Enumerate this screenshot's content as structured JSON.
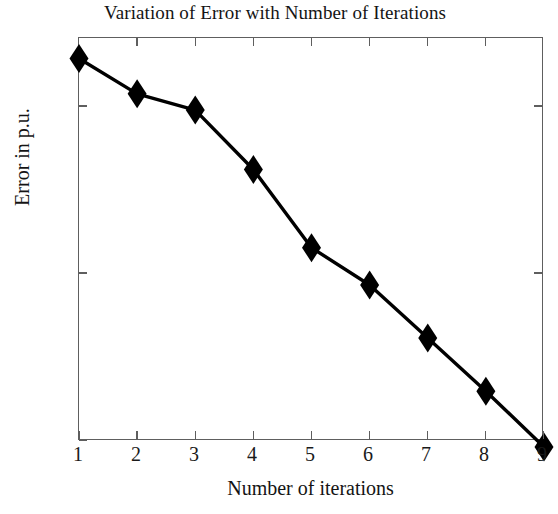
{
  "chart_data": {
    "type": "line",
    "title": "Variation of Error with Number of Iterations",
    "xlabel": "Number of iterations",
    "ylabel": "Error in p.u.",
    "x": [
      1,
      2,
      3,
      4,
      5,
      6,
      7,
      8,
      9
    ],
    "values": [
      25,
      2.2,
      0.72,
      0.012,
      5.5e-05,
      4.2e-06,
      1.1e-07,
      2.8e-09,
      6e-11
    ],
    "series": [
      {
        "name": "Error",
        "marker": "diamond",
        "marker_color": "#000000",
        "line_color": "#000000",
        "values": [
          25,
          2.2,
          0.72,
          0.012,
          5.5e-05,
          4.2e-06,
          1.1e-07,
          2.8e-09,
          6e-11
        ]
      }
    ],
    "xlim": [
      1,
      9
    ],
    "ylim": [
      1e-10,
      1000
    ],
    "yscale": "log",
    "xscale": "linear",
    "grid": false,
    "legend": null,
    "xtick_labels": [
      "1",
      "2",
      "3",
      "4",
      "5",
      "6",
      "7",
      "8",
      "9"
    ],
    "xticks": [
      1,
      2,
      3,
      4,
      5,
      6,
      7,
      8,
      9
    ],
    "yticks": [
      1,
      1e-05,
      1e-10
    ],
    "ytick_labels": [
      {
        "mantissa": "10",
        "exponent": "0"
      },
      {
        "mantissa": "10",
        "exponent": "-5"
      },
      {
        "mantissa": "10",
        "exponent": "-10"
      }
    ],
    "axis_color": "#5e5e5e",
    "background": "#ffffff"
  }
}
